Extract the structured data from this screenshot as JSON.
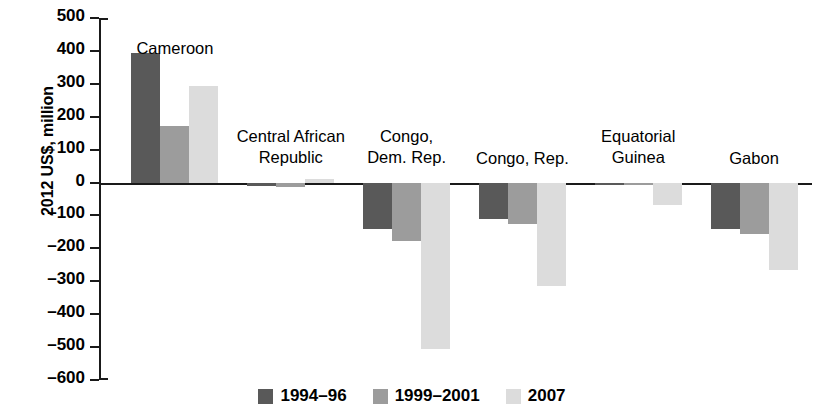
{
  "chart_data": {
    "type": "bar",
    "title": "",
    "subtitle": "",
    "xlabel": "",
    "ylabel": "2012 US$, million",
    "ylim": [
      -600,
      500
    ],
    "ytick_step": 100,
    "yticks": [
      500,
      400,
      300,
      200,
      100,
      0,
      "-100",
      "-200",
      "-300",
      "-400",
      "-500",
      "-600"
    ],
    "ytick_labels": [
      "500",
      "400",
      "300",
      "200",
      "100",
      "0",
      "–100",
      "–200",
      "–300",
      "–400",
      "–500",
      "–600"
    ],
    "grid": false,
    "legend_position": "bottom",
    "categories": [
      "Cameroon",
      "Central African Republic",
      "Congo, Dem. Rep.",
      "Congo, Rep.",
      "Equatorial Guinea",
      "Gabon"
    ],
    "category_label_lines": [
      [
        "Cameroon"
      ],
      [
        "Central African",
        "Republic"
      ],
      [
        "Congo,",
        "Dem. Rep."
      ],
      [
        "Congo, Rep."
      ],
      [
        "Equatorial",
        "Guinea"
      ],
      [
        "Gabon"
      ]
    ],
    "series": [
      {
        "name": "1994–96",
        "color": "#595959",
        "values": [
          395,
          -12,
          -140,
          -110,
          -4,
          -142
        ]
      },
      {
        "name": "1999–2001",
        "color": "#9c9c9c",
        "values": [
          173,
          -14,
          -178,
          -125,
          -5,
          -155
        ]
      },
      {
        "name": "2007",
        "color": "#dcdcdc",
        "values": [
          293,
          10,
          -505,
          -315,
          -68,
          -265
        ]
      }
    ]
  },
  "legend": {
    "items": [
      {
        "label": "1994–96",
        "color": "#595959"
      },
      {
        "label": "1999–2001",
        "color": "#9c9c9c"
      },
      {
        "label": "2007",
        "color": "#dcdcdc"
      }
    ]
  },
  "axis": {
    "y_title": "2012 US$, million"
  },
  "colors": {
    "axis": "#1a1a1a",
    "text": "#000000",
    "background": "#ffffff"
  }
}
